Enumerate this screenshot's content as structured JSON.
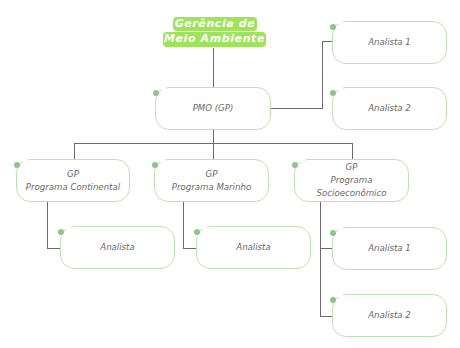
{
  "title": {
    "line1": "Gerência de",
    "line2": "Meio Ambiente"
  },
  "pmo": {
    "label": "PMO (GP)"
  },
  "pmo_analysts": [
    {
      "label": "Analista 1"
    },
    {
      "label": "Analista 2"
    }
  ],
  "programs": [
    {
      "role": "GP",
      "name": "Programa Continental",
      "analysts": [
        {
          "label": "Analista"
        }
      ]
    },
    {
      "role": "GP",
      "name": "Programa Marinho",
      "analysts": [
        {
          "label": "Analista"
        }
      ]
    },
    {
      "role": "GP",
      "name": "Programa Socioeconômico",
      "analysts": [
        {
          "label": "Analista 1"
        },
        {
          "label": "Analista 2"
        }
      ]
    }
  ],
  "colors": {
    "title_bg": "#9ee35b",
    "node_border": "#bfe0b5",
    "node_dot": "#8fc48a",
    "connector": "#6b6b6b"
  }
}
